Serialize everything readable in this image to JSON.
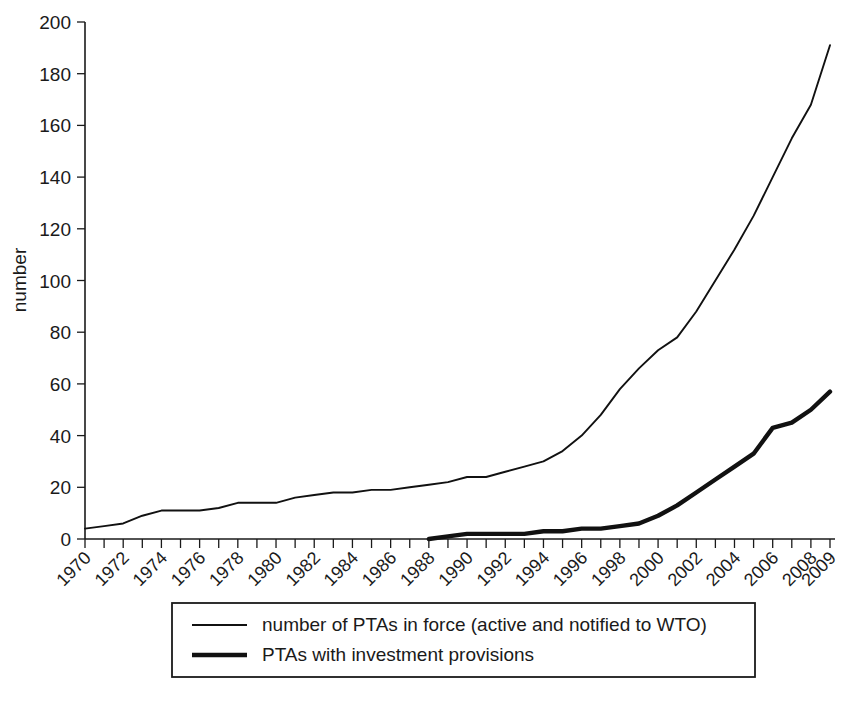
{
  "chart_data": {
    "type": "line",
    "title": "",
    "xlabel": "",
    "ylabel": "number",
    "xlim": [
      1970,
      2009
    ],
    "ylim": [
      0,
      200
    ],
    "grid": false,
    "legend_position": "bottom",
    "x": [
      1970,
      1971,
      1972,
      1973,
      1974,
      1975,
      1976,
      1977,
      1978,
      1979,
      1980,
      1981,
      1982,
      1983,
      1984,
      1985,
      1986,
      1987,
      1988,
      1989,
      1990,
      1991,
      1992,
      1993,
      1994,
      1995,
      1996,
      1997,
      1998,
      1999,
      2000,
      2001,
      2002,
      2003,
      2004,
      2005,
      2006,
      2007,
      2008,
      2009
    ],
    "xtick_labels": [
      "1970",
      "1972",
      "1974",
      "1976",
      "1978",
      "1980",
      "1982",
      "1984",
      "1986",
      "1988",
      "1990",
      "1992",
      "1994",
      "1996",
      "1998",
      "2000",
      "2002",
      "2004",
      "2006",
      "2008",
      "2009"
    ],
    "xtick_values": [
      1970,
      1972,
      1974,
      1976,
      1978,
      1980,
      1982,
      1984,
      1986,
      1988,
      1990,
      1992,
      1994,
      1996,
      1998,
      2000,
      2002,
      2004,
      2006,
      2008,
      2009
    ],
    "ytick_labels": [
      "0",
      "20",
      "40",
      "60",
      "80",
      "100",
      "120",
      "140",
      "160",
      "180",
      "200"
    ],
    "ytick_values": [
      0,
      20,
      40,
      60,
      80,
      100,
      120,
      140,
      160,
      180,
      200
    ],
    "series": [
      {
        "name": "number of PTAs in force (active and notified to WTO)",
        "style": "thin",
        "color": "#111111",
        "values": [
          4,
          5,
          6,
          9,
          11,
          11,
          11,
          12,
          14,
          14,
          14,
          16,
          17,
          18,
          18,
          19,
          19,
          20,
          21,
          22,
          24,
          24,
          26,
          28,
          30,
          34,
          40,
          48,
          58,
          66,
          73,
          78,
          88,
          100,
          112,
          125,
          140,
          155,
          168,
          191
        ]
      },
      {
        "name": "PTAs with investment provisions",
        "style": "thick",
        "color": "#111111",
        "values": [
          null,
          null,
          null,
          null,
          null,
          null,
          null,
          null,
          null,
          null,
          null,
          null,
          null,
          null,
          null,
          null,
          null,
          null,
          0,
          1,
          2,
          2,
          2,
          2,
          3,
          3,
          4,
          4,
          5,
          6,
          9,
          13,
          18,
          23,
          28,
          33,
          43,
          45,
          50,
          57
        ]
      }
    ]
  },
  "legend": {
    "entries": [
      {
        "label": "number of PTAs in force (active and notified to WTO)",
        "style": "thin"
      },
      {
        "label": "PTAs with investment provisions",
        "style": "thick"
      }
    ]
  },
  "axes": {
    "y_title": "number"
  },
  "colors": {
    "line": "#111111",
    "axis": "#1a1a1a",
    "background": "#ffffff"
  }
}
